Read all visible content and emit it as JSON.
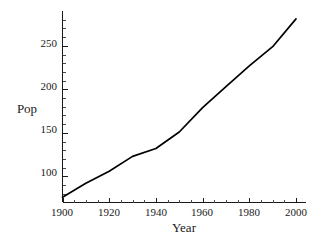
{
  "chart_data": {
    "type": "line",
    "title": "",
    "xlabel": "Year",
    "ylabel": "Pop",
    "xlim": [
      1900,
      2000
    ],
    "ylim": [
      70,
      290
    ],
    "grid": false,
    "legend": "none",
    "line_color": "#000000",
    "x": [
      1900,
      1910,
      1920,
      1930,
      1940,
      1950,
      1960,
      1970,
      1980,
      1990,
      2000
    ],
    "values": [
      76,
      92,
      106,
      123,
      132,
      151,
      179,
      203,
      227,
      249,
      281
    ],
    "series": [
      {
        "name": "Pop",
        "values": [
          76,
          92,
          106,
          123,
          132,
          151,
          179,
          203,
          227,
          249,
          281
        ]
      }
    ],
    "xticks": [
      1900,
      1920,
      1940,
      1960,
      1980,
      2000
    ],
    "xtick_labels": [
      "1900",
      "1920",
      "1940",
      "1960",
      "1980",
      "2000"
    ],
    "xminor_step": 5,
    "yticks": [
      100,
      150,
      200,
      250
    ],
    "ytick_labels": [
      "100",
      "150",
      "200",
      "250"
    ],
    "yminor_step": 10
  },
  "axes": {
    "x_title": "Year",
    "y_title": "Pop"
  },
  "xtick_labels": {
    "t0": "1900",
    "t1": "1920",
    "t2": "1940",
    "t3": "1960",
    "t4": "1980",
    "t5": "2000"
  },
  "ytick_labels": {
    "t0": "100",
    "t1": "150",
    "t2": "200",
    "t3": "250"
  }
}
